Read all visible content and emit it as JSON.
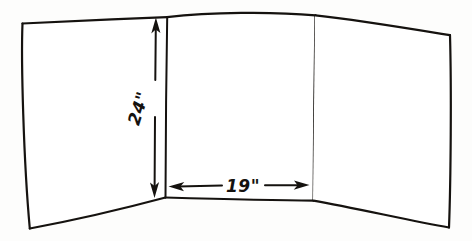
{
  "document": {
    "kind": "hand-drawn-sketch",
    "subject": "trifold panel with dimensions",
    "background_color": "#fdfdfc",
    "ink_color": "#15120f"
  },
  "dimensions": {
    "height": {
      "label": "24\"",
      "value": 24,
      "unit": "inch",
      "orientation": "vertical",
      "arrow_style": "double-headed",
      "icon": "vertical-dimension-arrow-icon"
    },
    "width": {
      "label": "19\"",
      "value": 19,
      "unit": "inch",
      "orientation": "horizontal",
      "arrow_style": "double-headed",
      "icon": "horizontal-dimension-arrow-icon"
    }
  },
  "panels": [
    {
      "name": "left-panel",
      "position": "left"
    },
    {
      "name": "center-panel",
      "position": "center"
    },
    {
      "name": "right-panel",
      "position": "right"
    }
  ]
}
